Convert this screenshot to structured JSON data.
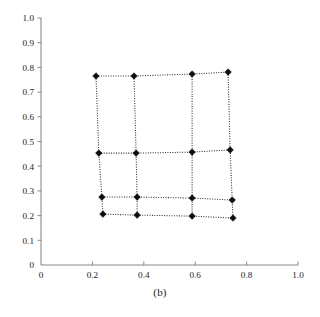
{
  "figure": {
    "caption": "(b)",
    "background_color": "#ffffff",
    "axis_color": "#8a8a8a",
    "mesh_color": "#2b2b2b",
    "node_color": "#0d0d0d"
  },
  "chart_data": {
    "type": "scatter",
    "title": "",
    "subtitle": "",
    "xlabel": "",
    "ylabel": "",
    "annotation": "(b)",
    "grid": false,
    "legend": null,
    "xlim": [
      0,
      1.0
    ],
    "ylim": [
      0,
      1.0
    ],
    "xticks": [
      0,
      0.2,
      0.4,
      0.6,
      0.8,
      1.0
    ],
    "xtick_labels": [
      "0",
      "0.2",
      "0.4",
      "0.6",
      "0.8",
      "1.0"
    ],
    "yticks": [
      0,
      0.1,
      0.2,
      0.3,
      0.4,
      0.5,
      0.6,
      0.7,
      0.8,
      0.9,
      1.0
    ],
    "ytick_labels": [
      "0",
      "0.1",
      "0.2",
      "0.3",
      "0.4",
      "0.5",
      "0.6",
      "0.7",
      "0.8",
      "0.9",
      "1.0"
    ],
    "mesh": {
      "rows": 4,
      "cols": 4,
      "marker": "filled-diamond",
      "edge_style": "dotted",
      "nodes": [
        [
          {
            "x": 0.214,
            "y": 0.765
          },
          {
            "x": 0.362,
            "y": 0.765
          },
          {
            "x": 0.588,
            "y": 0.773
          },
          {
            "x": 0.728,
            "y": 0.781
          }
        ],
        [
          {
            "x": 0.225,
            "y": 0.453
          },
          {
            "x": 0.37,
            "y": 0.453
          },
          {
            "x": 0.588,
            "y": 0.457
          },
          {
            "x": 0.736,
            "y": 0.466
          }
        ],
        [
          {
            "x": 0.237,
            "y": 0.275
          },
          {
            "x": 0.374,
            "y": 0.275
          },
          {
            "x": 0.588,
            "y": 0.271
          },
          {
            "x": 0.744,
            "y": 0.263
          }
        ],
        [
          {
            "x": 0.241,
            "y": 0.206
          },
          {
            "x": 0.374,
            "y": 0.202
          },
          {
            "x": 0.588,
            "y": 0.198
          },
          {
            "x": 0.747,
            "y": 0.19
          }
        ]
      ]
    }
  }
}
